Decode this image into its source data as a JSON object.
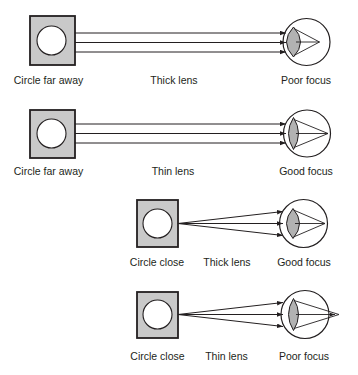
{
  "figure": {
    "rows": [
      {
        "object_label": "Circle far away",
        "lens_label": "Thick lens",
        "focus_label": "Poor focus",
        "object_distance": "far",
        "lens_type": "thick",
        "focus_quality": "poor",
        "focal_point": "in front of retina"
      },
      {
        "object_label": "Circle far away",
        "lens_label": "Thin lens",
        "focus_label": "Good focus",
        "object_distance": "far",
        "lens_type": "thin",
        "focus_quality": "good",
        "focal_point": "on retina"
      },
      {
        "object_label": "Circle close",
        "lens_label": "Thick lens",
        "focus_label": "Good focus",
        "object_distance": "close",
        "lens_type": "thick",
        "focus_quality": "good",
        "focal_point": "on retina"
      },
      {
        "object_label": "Circle close",
        "lens_label": "Thin lens",
        "focus_label": "Poor focus",
        "object_distance": "close",
        "lens_type": "thin",
        "focus_quality": "poor",
        "focal_point": "behind retina"
      }
    ],
    "colors": {
      "square_fill": "#c9c9c9",
      "lens_fill": "#b2b2b2",
      "line": "#231f20",
      "background": "#ffffff"
    }
  }
}
